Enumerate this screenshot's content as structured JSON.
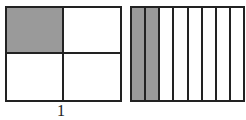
{
  "figures": [
    {
      "name": "left-grid",
      "rows": 2,
      "cols": 2,
      "shaded": [
        [
          0,
          0
        ]
      ],
      "label": "1"
    },
    {
      "name": "right-grid",
      "rows": 1,
      "cols": 8,
      "shaded": [
        [
          0,
          0
        ],
        [
          0,
          1
        ]
      ]
    }
  ],
  "colors": {
    "shade": "#9a9a9a",
    "line": "#222222",
    "background": "#ffffff"
  }
}
